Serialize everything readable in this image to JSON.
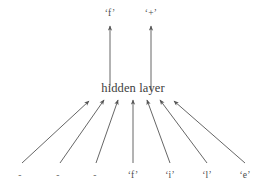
{
  "diagram": {
    "background_color": "#ffffff",
    "line_color": "#555555",
    "text_color": "#4a4a4a",
    "hidden": {
      "label": "hidden layer",
      "x": 133,
      "y": 88
    },
    "outputs": [
      {
        "label": "‘f’",
        "char": "f",
        "x": 110,
        "y": 14,
        "arrow_x": 110,
        "arrow_from_y": 86,
        "arrow_to_y": 26
      },
      {
        "label": "‘+’",
        "char": "+",
        "x": 151,
        "y": 14,
        "arrow_x": 151,
        "arrow_from_y": 90,
        "arrow_to_y": 26
      }
    ],
    "inputs": [
      {
        "label": "-",
        "char": "-",
        "x": 20,
        "y": 176,
        "tail_x": 22,
        "tail_y": 163,
        "tip_x": 89,
        "tip_y": 101,
        "is_padding": true
      },
      {
        "label": "-",
        "char": "-",
        "x": 58,
        "y": 176,
        "tail_x": 60,
        "tail_y": 163,
        "tip_x": 104,
        "tip_y": 100,
        "is_padding": true
      },
      {
        "label": "-",
        "char": "-",
        "x": 95,
        "y": 176,
        "tail_x": 96,
        "tail_y": 163,
        "tip_x": 118,
        "tip_y": 100,
        "is_padding": true
      },
      {
        "label": "‘f’",
        "char": "f",
        "x": 133,
        "y": 176,
        "tail_x": 133,
        "tail_y": 163,
        "tip_x": 133,
        "tip_y": 100,
        "is_padding": false
      },
      {
        "label": "‘i’",
        "char": "i",
        "x": 170,
        "y": 176,
        "tail_x": 170,
        "tail_y": 163,
        "tip_x": 147,
        "tip_y": 100,
        "is_padding": false
      },
      {
        "label": "‘l’",
        "char": "l",
        "x": 207,
        "y": 176,
        "tail_x": 207,
        "tail_y": 163,
        "tip_x": 160,
        "tip_y": 100,
        "is_padding": false
      },
      {
        "label": "‘e’",
        "char": "e",
        "x": 245,
        "y": 176,
        "tail_x": 245,
        "tail_y": 163,
        "tip_x": 174,
        "tip_y": 101,
        "is_padding": false
      }
    ]
  }
}
